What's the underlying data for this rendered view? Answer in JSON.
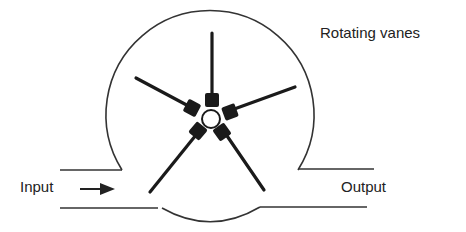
{
  "diagram": {
    "labels": {
      "vanes": "Rotating vanes",
      "input": "Input",
      "output": "Output"
    },
    "components": {
      "housing": "circular housing",
      "rotor_hub": "central hub",
      "vane_count": 5,
      "inlet_pipe": "left pipe",
      "outlet_pipe": "right pipe",
      "flow_arrow": "arrow pointing right"
    },
    "colors": {
      "line": "#333333",
      "vane": "#1a1a1a",
      "background": "#ffffff"
    }
  }
}
